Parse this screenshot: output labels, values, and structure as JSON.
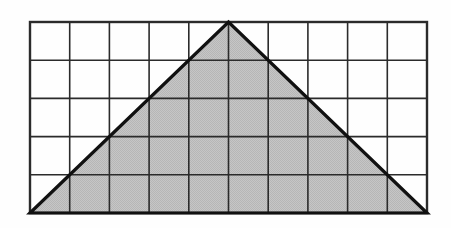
{
  "figure": {
    "type": "geometry-diagram",
    "caption": "",
    "background_color": "#fefefe"
  },
  "chart_data": {
    "type": "diagram",
    "xlabel": "",
    "ylabel": "",
    "grid": {
      "columns": 10,
      "rows": 5,
      "cell_width_px": 39.7,
      "cell_height_px": 38.2,
      "origin_x_px": 30,
      "origin_y_px": 22,
      "width_px": 397,
      "height_px": 191,
      "line_color": "#2b2b2b",
      "inner_line_width_px": 1.6,
      "border_line_width_px": 2.4,
      "grid_on": true
    },
    "shapes": [
      {
        "name": "shaded-triangle",
        "kind": "triangle",
        "vertices_grid": [
          [
            0,
            5
          ],
          [
            5,
            0
          ],
          [
            10,
            5
          ]
        ],
        "vertices_px": [
          [
            30,
            213
          ],
          [
            228.5,
            22
          ],
          [
            427,
            213
          ]
        ],
        "labels": [
          "bottom-left corner",
          "top apex at column 5",
          "bottom-right corner"
        ],
        "base_cells": 10,
        "height_cells": 5,
        "area_cells": 25,
        "fill_color": "#c2c2c2",
        "stroke_color": "#111111",
        "stroke_width_px": 3.2
      }
    ],
    "annotations": [],
    "legend": []
  }
}
